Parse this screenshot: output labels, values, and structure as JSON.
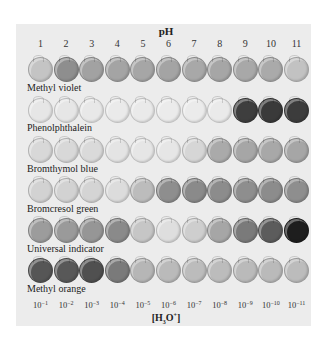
{
  "figure": {
    "x_axis_title": "pH",
    "bottom_axis_title": "[H3O+]",
    "ph_values": [
      "1",
      "2",
      "3",
      "4",
      "5",
      "6",
      "7",
      "8",
      "9",
      "10",
      "11"
    ],
    "concentrations": [
      {
        "base": "10",
        "exp": "−1"
      },
      {
        "base": "10",
        "exp": "−2"
      },
      {
        "base": "10",
        "exp": "−3"
      },
      {
        "base": "10",
        "exp": "−4"
      },
      {
        "base": "10",
        "exp": "−5"
      },
      {
        "base": "10",
        "exp": "−6"
      },
      {
        "base": "10",
        "exp": "−7"
      },
      {
        "base": "10",
        "exp": "−8"
      },
      {
        "base": "10",
        "exp": "−9"
      },
      {
        "base": "10",
        "exp": "−10"
      },
      {
        "base": "10",
        "exp": "−11"
      }
    ],
    "indicators": [
      {
        "name": "Methyl violet",
        "shades": [
          "#c4c4c4",
          "#8e8e8e",
          "#a2a2a2",
          "#a4a4a4",
          "#a6a6a6",
          "#a4a4a4",
          "#a8a8a8",
          "#a6a6a6",
          "#a8a8a8",
          "#aaaaaa",
          "#c2c2c2"
        ]
      },
      {
        "name": "Phenolphthalein",
        "shades": [
          "#e6e6e6",
          "#e6e6e6",
          "#e8e8e8",
          "#eaeaea",
          "#eaeaea",
          "#ebebeb",
          "#ebebeb",
          "#eaeaea",
          "#3e3e3e",
          "#3a3a3a",
          "#3c3c3c"
        ]
      },
      {
        "name": "Bromthymol blue",
        "shades": [
          "#d8d8d8",
          "#d8d8d8",
          "#dadada",
          "#e4e4e4",
          "#e6e6e6",
          "#e6e6e6",
          "#d6d6d6",
          "#aaaaaa",
          "#a6a6a6",
          "#a8a8a8",
          "#a6a6a6"
        ]
      },
      {
        "name": "Bromcresol green",
        "shades": [
          "#d2d2d2",
          "#d2d2d2",
          "#d4d4d4",
          "#dcdcdc",
          "#bcbcbc",
          "#8e8e8e",
          "#8a8a8a",
          "#8c8c8c",
          "#8e8e8e",
          "#8c8c8c",
          "#8e8e8e"
        ]
      },
      {
        "name": "Universal indicator",
        "shades": [
          "#9c9c9c",
          "#9a9a9a",
          "#969696",
          "#8a8a8a",
          "#c6c6c6",
          "#dedede",
          "#cecece",
          "#a6a6a6",
          "#7a7a7a",
          "#5c5c5c",
          "#1e1e1e"
        ]
      },
      {
        "name": "Methyl orange",
        "shades": [
          "#565656",
          "#585858",
          "#505050",
          "#7a7a7a",
          "#b6b6b6",
          "#bababa",
          "#bcbcbc",
          "#bcbcbc",
          "#bababa",
          "#bababa",
          "#bcbcbc"
        ]
      }
    ]
  }
}
